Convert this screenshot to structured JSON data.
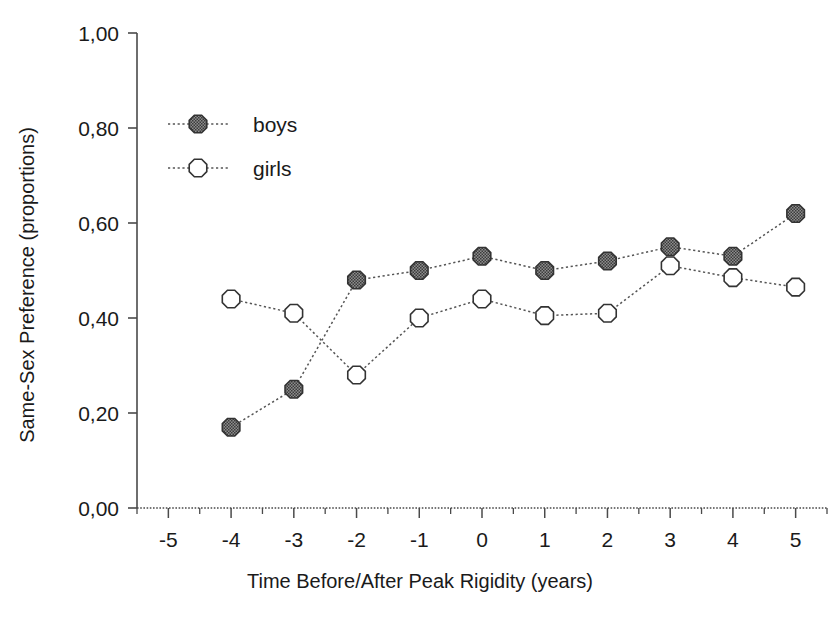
{
  "chart_data": {
    "type": "line",
    "title": "",
    "xlabel": "Time Before/After Peak Rigidity (years)",
    "ylabel": "Same-Sex Preference (proportions)",
    "x": [
      -5,
      -4,
      -3,
      -2,
      -1,
      0,
      1,
      2,
      3,
      4,
      5
    ],
    "xtick_labels": [
      "-5",
      "-4",
      "-3",
      "-2",
      "-1",
      "0",
      "1",
      "2",
      "3",
      "4",
      "5"
    ],
    "ytick_labels": [
      "0,00",
      "0,20",
      "0,40",
      "0,60",
      "0,80",
      "1,00"
    ],
    "ytick_values": [
      0.0,
      0.2,
      0.4,
      0.6,
      0.8,
      1.0
    ],
    "xlim": [
      -5.5,
      5.5
    ],
    "ylim": [
      0.0,
      1.0
    ],
    "grid": false,
    "legend_position": "upper-left",
    "series": [
      {
        "name": "boys",
        "marker": "filled-circle",
        "marker_color": "#6b6b6b",
        "marker_edge_color": "#333333",
        "line_style": "dotted",
        "x": [
          -4,
          -3,
          -2,
          -1,
          0,
          1,
          2,
          3,
          4,
          5
        ],
        "values": [
          0.17,
          0.25,
          0.48,
          0.5,
          0.53,
          0.5,
          0.52,
          0.55,
          0.53,
          0.62
        ]
      },
      {
        "name": "girls",
        "marker": "open-circle",
        "marker_color": "#ffffff",
        "marker_edge_color": "#333333",
        "line_style": "dotted",
        "x": [
          -4,
          -3,
          -2,
          -1,
          0,
          1,
          2,
          3,
          4,
          5
        ],
        "values": [
          0.44,
          0.41,
          0.28,
          0.4,
          0.44,
          0.405,
          0.41,
          0.51,
          0.485,
          0.465
        ]
      }
    ]
  },
  "legend": {
    "entries": [
      {
        "label": "boys"
      },
      {
        "label": "girls"
      }
    ]
  },
  "colors": {
    "axis": "#4a4a4a",
    "text": "#1a1a1a",
    "boys_fill": "#6b6b6b",
    "girls_fill": "#ffffff",
    "marker_edge": "#333333"
  }
}
